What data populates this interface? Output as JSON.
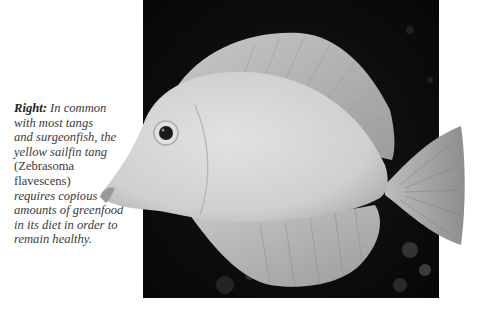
{
  "caption": {
    "lead": "Right:",
    "lines": [
      " In common",
      "with most tangs",
      "and surgeonfish, the",
      "yellow sailfin tang",
      "(Zebrasoma",
      "flavescens)",
      "requires copious",
      "amounts of greenfood",
      "in its diet in order to",
      "remain healthy."
    ]
  },
  "photo": {
    "subject": "yellow sailfin tang (Zebrasoma flavescens)",
    "background_color": "#0c0c0c",
    "fish_color": "#d4d4d4"
  }
}
